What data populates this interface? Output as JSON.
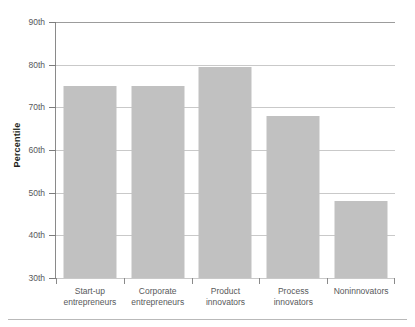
{
  "chart_data": {
    "type": "bar",
    "title": "",
    "xlabel": "",
    "ylabel": "Percentile",
    "categories": [
      "Start-up entrepreneurs",
      "Corporate entrepreneurs",
      "Product innovators",
      "Process innovators",
      "Noninnovators"
    ],
    "category_lines": [
      [
        "Start-up",
        "entrepreneurs"
      ],
      [
        "Corporate",
        "entrepreneurs"
      ],
      [
        "Product",
        "innovators"
      ],
      [
        "Process",
        "innovators"
      ],
      [
        "Noninnovators",
        ""
      ]
    ],
    "values": [
      75,
      75,
      79.5,
      68,
      48
    ],
    "ylim": [
      30,
      90
    ],
    "ytick_values": [
      30,
      40,
      50,
      60,
      70,
      80,
      90
    ],
    "ytick_labels": [
      "30th",
      "40th",
      "50th",
      "60th",
      "70th",
      "80th",
      "90th"
    ],
    "grid": true,
    "legend": false,
    "bar_color": "#c1c1c1",
    "gridline_color": "#c9c9c9",
    "axis_color": "#8a8a8a",
    "text_color": "#58595b",
    "title_color": "#231f20"
  }
}
